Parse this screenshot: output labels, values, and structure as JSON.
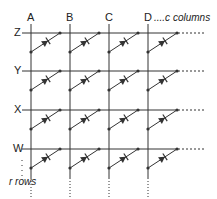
{
  "columns": [
    {
      "label": "A",
      "x": 31
    },
    {
      "label": "B",
      "x": 70
    },
    {
      "label": "C",
      "x": 109
    },
    {
      "label": "D",
      "x": 148
    }
  ],
  "rows": [
    {
      "label": "Z",
      "y": 33
    },
    {
      "label": "Y",
      "y": 71
    },
    {
      "label": "X",
      "y": 110
    },
    {
      "label": "W",
      "y": 149
    }
  ],
  "columns_note": "....c columns",
  "rows_note": "r rows",
  "colors": {
    "line": "#333333"
  }
}
